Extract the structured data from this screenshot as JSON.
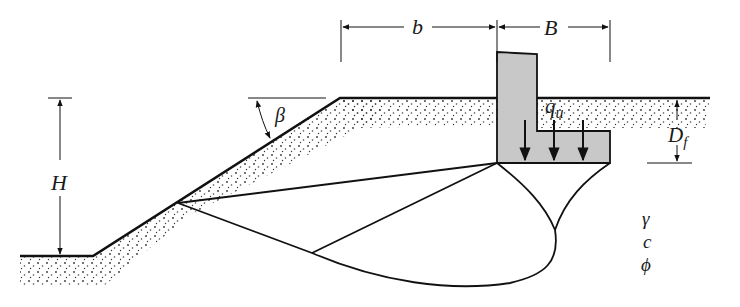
{
  "diagram": {
    "labels": {
      "slope_height": "H",
      "slope_angle": "β",
      "setback_distance": "b",
      "footing_width": "B",
      "bearing_pressure": "q",
      "bearing_pressure_subscript": "u",
      "depth": "D",
      "depth_subscript": "f",
      "unit_weight": "γ",
      "cohesion": "c",
      "friction_angle": "ϕ"
    },
    "colors": {
      "line": "#111111",
      "footing_fill": "#c8c8c8",
      "soil_dots": "#333333",
      "background": "#ffffff"
    }
  }
}
